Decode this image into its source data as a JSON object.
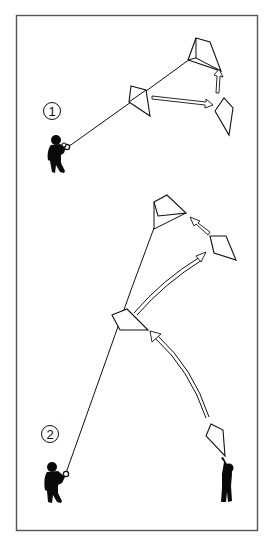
{
  "figure": {
    "frame_color": "#555555",
    "ink_color": "#111111",
    "scenes": [
      {
        "label": "1",
        "elements": [
          "kite-flyer-with-reel",
          "kite-line",
          "kite-low",
          "kite-high",
          "kite-right",
          "arrow-right",
          "arrow-up"
        ]
      },
      {
        "label": "2",
        "elements": [
          "kite-flyer-with-reel",
          "kite-helper-launching",
          "kite-line",
          "kite-mid",
          "kite-top",
          "kite-side",
          "arrow-curved-long",
          "arrow-curved-up",
          "arrow-diagonal"
        ]
      }
    ]
  }
}
